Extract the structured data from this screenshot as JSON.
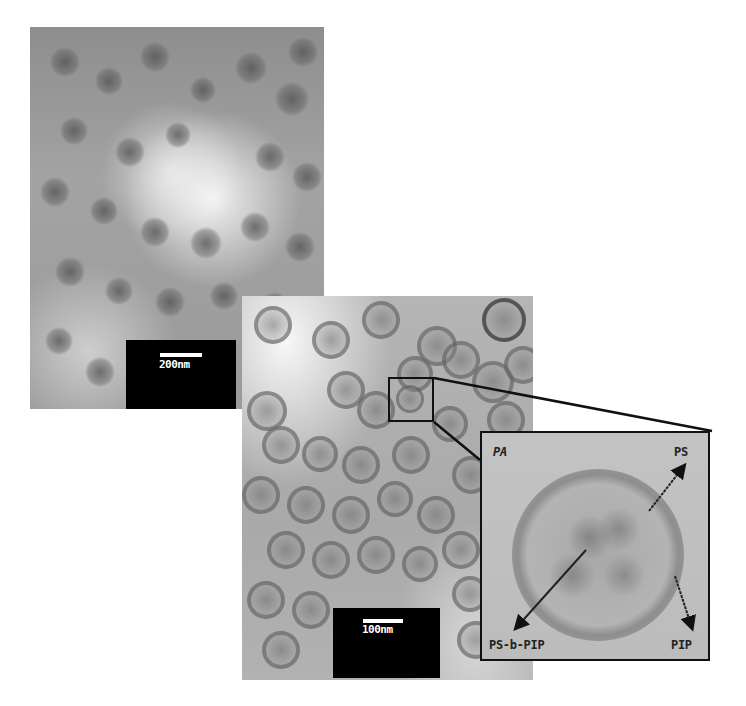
{
  "figure": {
    "panel_a": {
      "scale_bar_label": "200nm"
    },
    "panel_b": {
      "scale_bar_label": "100nm"
    },
    "inset": {
      "corner_label": "PA",
      "labels": {
        "shell": "PS",
        "core": "PS-b-PIP",
        "domain": "PIP"
      }
    },
    "colors": {
      "scale_box": "#000000",
      "frame": "#111111",
      "label_text": "#222222"
    }
  }
}
